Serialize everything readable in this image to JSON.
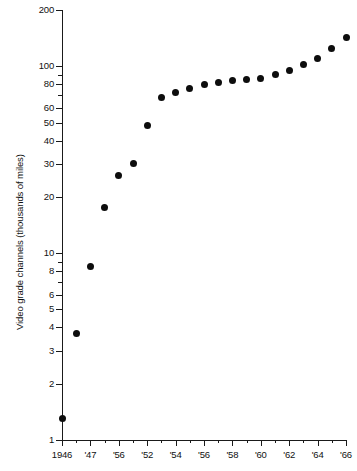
{
  "chart_data": {
    "type": "scatter",
    "title": "",
    "xlabel": "",
    "ylabel": "Video grade channels (thousands of miles)",
    "yscale": "log",
    "ylim": [
      1,
      200
    ],
    "xlim": [
      1946,
      1966
    ],
    "grid": false,
    "legend": null,
    "y_ticks": [
      1,
      2,
      3,
      4,
      5,
      6,
      8,
      10,
      20,
      30,
      40,
      50,
      60,
      80,
      100,
      200
    ],
    "y_tick_labels": [
      "1",
      "2",
      "3",
      "4",
      "5",
      "6",
      "8",
      "10",
      "20",
      "30",
      "40",
      "50",
      "60",
      "80",
      "100",
      "200"
    ],
    "x_ticks": [
      1946,
      1948,
      1950,
      1952,
      1954,
      1956,
      1958,
      1960,
      1962,
      1964,
      1966
    ],
    "x_tick_labels": [
      "1946",
      "'47",
      "'56",
      "'52",
      "'54",
      "'56",
      "'58",
      "'60",
      "'62",
      "'64",
      "'66"
    ],
    "x": [
      1946,
      1947,
      1948,
      1949,
      1950,
      1951,
      1952,
      1953,
      1954,
      1955,
      1956,
      1957,
      1958,
      1959,
      1960,
      1961,
      1962,
      1963,
      1964,
      1965,
      1966
    ],
    "values": [
      1.3,
      3.7,
      8.5,
      17.5,
      26,
      30,
      48,
      68,
      72,
      76,
      80,
      82,
      84,
      85,
      86,
      90,
      95,
      102,
      110,
      125,
      143
    ],
    "series": [
      {
        "name": "Video grade channels",
        "marker": "filled-circle",
        "color": "#0d0d0d",
        "values": [
          1.3,
          3.7,
          8.5,
          17.5,
          26,
          30,
          48,
          68,
          72,
          76,
          80,
          82,
          84,
          85,
          86,
          90,
          95,
          102,
          110,
          125,
          143
        ]
      }
    ]
  },
  "axes": {
    "y_title": "Video grade channels (thousands of miles)"
  }
}
